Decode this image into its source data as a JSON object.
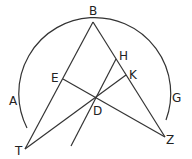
{
  "diagram": {
    "points": {
      "B": [
        93,
        22
      ],
      "T": [
        25,
        149
      ],
      "Z": [
        165,
        137
      ],
      "E": [
        63,
        79
      ],
      "H": [
        116,
        59
      ],
      "K": [
        126,
        75
      ],
      "D": [
        96,
        97
      ],
      "Hend": [
        71,
        146
      ]
    },
    "arc": {
      "cx": 96,
      "cy": 98,
      "r": 76,
      "start": [
        27,
        128
      ],
      "end": [
        166,
        120
      ]
    },
    "labels": [
      {
        "text": "B",
        "x": 89,
        "y": 15
      },
      {
        "text": "H",
        "x": 119,
        "y": 60
      },
      {
        "text": "E",
        "x": 51,
        "y": 82
      },
      {
        "text": "K",
        "x": 129,
        "y": 79
      },
      {
        "text": "A",
        "x": 9,
        "y": 105
      },
      {
        "text": "G",
        "x": 172,
        "y": 102
      },
      {
        "text": "D",
        "x": 93,
        "y": 115
      },
      {
        "text": "T",
        "x": 15,
        "y": 155
      },
      {
        "text": "Z",
        "x": 166,
        "y": 144
      }
    ],
    "color": "#333333"
  }
}
